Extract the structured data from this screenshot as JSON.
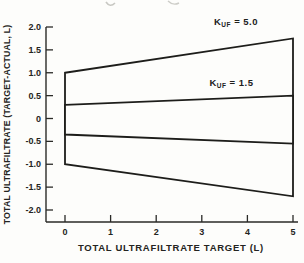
{
  "figure": {
    "background": "#fdfdfb",
    "line_color": "#1d1d1a",
    "axis_color": "#2a2a27",
    "text_color": "#242421"
  },
  "chart_data": {
    "type": "envelope-line",
    "title": "",
    "xlabel": "TOTAL ULTRAFILTRATE TARGET (L)",
    "ylabel": "TOTAL ULTRAFILTRATE (TARGET-ACTUAL, L)",
    "xlim": [
      0,
      5
    ],
    "ylim": [
      -2,
      2
    ],
    "xticks": [
      "0",
      "1",
      "2",
      "3",
      "4",
      "5"
    ],
    "yticks": [
      "2.0",
      "1.5",
      "1.0",
      "0.5",
      "0",
      "-0.5",
      "-1.0",
      "-1.5",
      "-2.0"
    ],
    "grid": false,
    "legend_position": "inline-labels",
    "series": [
      {
        "name": "KUF = 5.0",
        "label": {
          "base": "K",
          "sub": "UF",
          "eq": " = 5.0"
        },
        "label_pos": [
          3.75,
          2.05
        ],
        "upper": [
          [
            0,
            1.0
          ],
          [
            5,
            1.75
          ]
        ],
        "lower": [
          [
            0,
            -1.0
          ],
          [
            5,
            -1.7
          ]
        ]
      },
      {
        "name": "KUF = 1.5",
        "label": {
          "base": "K",
          "sub": "UF",
          "eq": " = 1.5"
        },
        "label_pos": [
          3.65,
          0.72
        ],
        "upper": [
          [
            0,
            0.3
          ],
          [
            5,
            0.5
          ]
        ],
        "lower": [
          [
            0,
            -0.35
          ],
          [
            5,
            -0.55
          ]
        ]
      }
    ]
  }
}
